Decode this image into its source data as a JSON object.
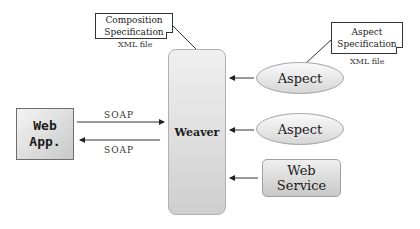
{
  "diagram": {
    "web_app": {
      "line1": "Web",
      "line2": "App."
    },
    "weaver": {
      "label": "Weaver"
    },
    "aspects": [
      {
        "label": "Aspect"
      },
      {
        "label": "Aspect"
      }
    ],
    "web_service": {
      "line1": "Web",
      "line2": "Service"
    },
    "composition_spec": {
      "line1": "Composition",
      "line2": "Specification",
      "file_note": "XML file"
    },
    "aspect_spec": {
      "line1": "Aspect",
      "line2": "Specification",
      "file_note": "XML file"
    },
    "connections": {
      "request_label": "SOAP",
      "response_label": "SOAP"
    }
  }
}
